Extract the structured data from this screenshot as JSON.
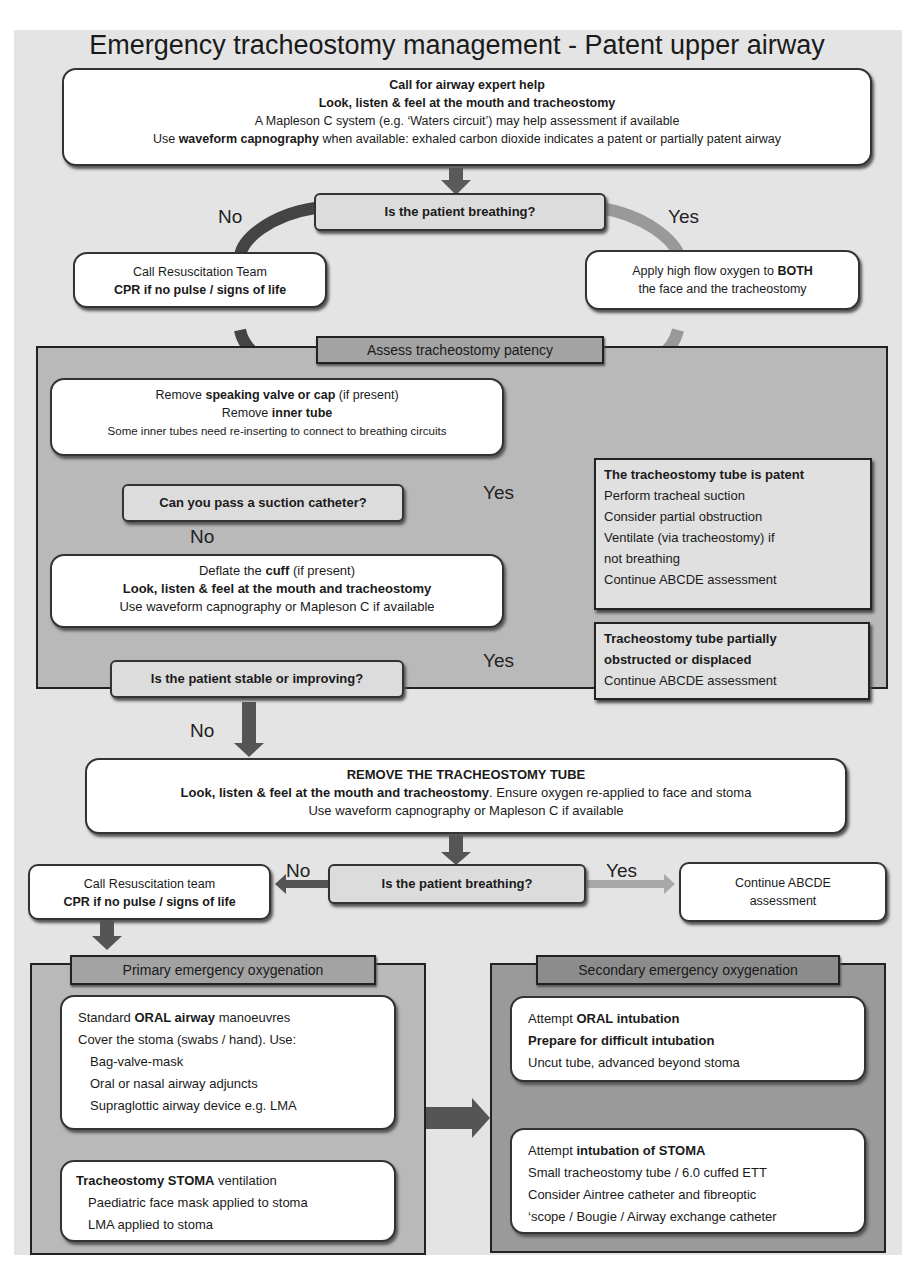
{
  "title": "Emergency tracheostomy management - Patent upper airway",
  "top_box": {
    "line1": "Call for airway expert help",
    "line2": "Look, listen & feel at the mouth and tracheostomy",
    "line3": "A Mapleson C system (e.g. ‘Waters circuit’) may help assessment if available",
    "line4_pre": "Use ",
    "line4_bold": "waveform capnography",
    "line4_post": " when available:  exhaled carbon dioxide indicates a patent or partially patent airway"
  },
  "q1": {
    "text": "Is the patient breathing?",
    "no": "No",
    "yes": "Yes"
  },
  "resus1": {
    "line1": "Call Resuscitation Team",
    "line2": "CPR if no pulse / signs of life"
  },
  "oxygen": {
    "line1_pre": "Apply high flow oxygen to ",
    "line1_bold": "BOTH",
    "line2": "the face and the tracheostomy"
  },
  "patency": {
    "header": "Assess tracheostomy patency",
    "remove_box": {
      "l1_pre": "Remove ",
      "l1_bold": "speaking valve or cap",
      "l1_post": " (if present)",
      "l2_pre": "Remove ",
      "l2_bold": "inner tube",
      "l3": "Some inner tubes need re-inserting to connect to breathing circuits"
    },
    "q_suction": {
      "text": "Can you pass a suction catheter?",
      "yes": "Yes",
      "no": "No"
    },
    "patent_box": {
      "title": "The tracheostomy tube is patent",
      "items": [
        "Perform tracheal suction",
        "Consider partial obstruction",
        "Ventilate (via tracheostomy) if",
        "not breathing",
        "Continue ABCDE assessment"
      ]
    },
    "deflate_box": {
      "l1_pre": "Deflate the ",
      "l1_bold": "cuff",
      "l1_post": " (if present)",
      "l2": "Look, listen & feel at the mouth and tracheostomy",
      "l3": "Use waveform capnography or Mapleson C if available"
    },
    "q_stable": {
      "text": "Is the patient stable or improving?",
      "yes": "Yes",
      "no": "No"
    },
    "partial_box": {
      "title_l1": "Tracheostomy tube partially",
      "title_l2": "obstructed or displaced",
      "item": "Continue ABCDE assessment"
    }
  },
  "remove_tube": {
    "l1": "REMOVE THE TRACHEOSTOMY TUBE",
    "l2_bold": "Look, listen & feel at the mouth and tracheostomy",
    "l2_post": ". Ensure oxygen re-applied to face and stoma",
    "l3": "Use waveform capnography or Mapleson C if available"
  },
  "q2": {
    "text": "Is the patient breathing?",
    "no": "No",
    "yes": "Yes"
  },
  "resus2": {
    "line1": "Call Resuscitation team",
    "line2": "CPR if no pulse / signs of life"
  },
  "continue_box": {
    "line1": "Continue ABCDE",
    "line2": "assessment"
  },
  "primary": {
    "header": "Primary emergency oxygenation",
    "box1": {
      "l1_pre": "Standard ",
      "l1_bold": "ORAL airway",
      "l1_post": " manoeuvres",
      "l2": "Cover the stoma (swabs / hand). Use:",
      "items": [
        "Bag-valve-mask",
        "Oral or nasal airway adjuncts",
        "Supraglottic airway device e.g. LMA"
      ]
    },
    "box2": {
      "l1_bold": "Tracheostomy STOMA",
      "l1_post": " ventilation",
      "items": [
        "Paediatric face mask applied to stoma",
        "LMA applied to stoma"
      ]
    }
  },
  "secondary": {
    "header": "Secondary emergency oxygenation",
    "box1": {
      "l1_pre": "Attempt ",
      "l1_bold": "ORAL intubation",
      "l2": "Prepare for difficult intubation",
      "l3": "Uncut tube, advanced beyond stoma"
    },
    "box2": {
      "l1_pre": "Attempt ",
      "l1_bold": "intubation of STOMA",
      "items": [
        "Small tracheostomy tube / 6.0 cuffed ETT",
        "Consider Aintree catheter and fibreoptic",
        "‘scope / Bougie / Airway exchange catheter"
      ]
    }
  },
  "colors": {
    "background": "#e4e4e4",
    "panel_mid": "#b9b9b9",
    "panel_dark": "#9a9a9a",
    "arrow_dark": "#555555",
    "arrow_light": "#a8a8a8"
  }
}
